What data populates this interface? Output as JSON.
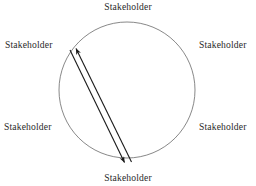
{
  "figure": {
    "type": "stakeholder-circle-diagram",
    "background_color": "#ffffff",
    "stroke_color": "#555555",
    "arrow_color": "#1a1a1a",
    "text_color": "#2a2a2a"
  },
  "circle": {
    "center_x": 127,
    "center_y": 90,
    "radius": 68,
    "stroke_width": 0.8
  },
  "labels": {
    "top": "Stakeholder",
    "upper_left": "Stakeholder",
    "upper_right": "Stakeholder",
    "lower_left": "Stakeholder",
    "lower_right": "Stakeholder",
    "bottom": "Stakeholder"
  },
  "arrows": [
    {
      "name": "arrow-up-left",
      "direction": "from bottom-right to top-left",
      "x1": 131,
      "y1": 162,
      "x2": 75,
      "y2": 47,
      "arrowhead_at": "end"
    },
    {
      "name": "arrow-down-right",
      "direction": "from top-left to bottom-right",
      "x1": 70,
      "y1": 50,
      "x2": 125,
      "y2": 164,
      "arrowhead_at": "end"
    }
  ]
}
